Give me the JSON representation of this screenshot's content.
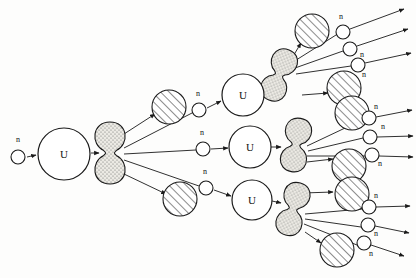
{
  "figure": {
    "domain": "Diagram",
    "width": 416,
    "height": 278,
    "background_color": "#fdfdfc",
    "stroke_color": "#1a1a1a",
    "fragment_fill": "#e8e6e0",
    "hatch_fill": "#ffffff"
  },
  "labels": {
    "neutron": "n",
    "uranium": "U"
  },
  "nuclei": [
    {
      "id": "u-seed",
      "label": "U",
      "cx": 64,
      "cy": 154,
      "r": 26
    },
    {
      "id": "u-top",
      "label": "U",
      "cx": 243,
      "cy": 95,
      "r": 21
    },
    {
      "id": "u-mid",
      "label": "U",
      "cx": 250,
      "cy": 147,
      "r": 21
    },
    {
      "id": "u-bot",
      "label": "U",
      "cx": 252,
      "cy": 200,
      "r": 20
    }
  ],
  "fragments": [
    {
      "id": "frag-seed",
      "cx": 110,
      "cy": 153,
      "rx": 15,
      "ry": 31,
      "rot": 0
    },
    {
      "id": "frag-top",
      "cx": 279,
      "cy": 75,
      "rx": 13,
      "ry": 27,
      "rot": 22
    },
    {
      "id": "frag-mid",
      "cx": 296,
      "cy": 145,
      "rx": 13,
      "ry": 27,
      "rot": 10
    },
    {
      "id": "frag-bot",
      "cx": 293,
      "cy": 209,
      "rx": 13,
      "ry": 27,
      "rot": 16
    }
  ],
  "products": [
    {
      "id": "prod-a",
      "cx": 169,
      "cy": 107,
      "r": 17
    },
    {
      "id": "prod-b",
      "cx": 180,
      "cy": 199,
      "r": 17
    },
    {
      "id": "prod-c",
      "cx": 312,
      "cy": 31,
      "r": 17
    },
    {
      "id": "prod-d",
      "cx": 344,
      "cy": 88,
      "r": 17
    },
    {
      "id": "prod-e",
      "cx": 352,
      "cy": 113,
      "r": 17
    },
    {
      "id": "prod-f",
      "cx": 349,
      "cy": 166,
      "r": 17
    },
    {
      "id": "prod-g",
      "cx": 352,
      "cy": 194,
      "r": 17
    },
    {
      "id": "prod-h",
      "cx": 337,
      "cy": 250,
      "r": 17
    }
  ],
  "neutrons": [
    {
      "id": "n-seed",
      "cx": 18,
      "cy": 157,
      "r": 7,
      "label": "n",
      "lx": 18,
      "ly": 142
    },
    {
      "id": "n-t1",
      "cx": 199,
      "cy": 110,
      "r": 7,
      "label": "n",
      "lx": 198,
      "ly": 96
    },
    {
      "id": "n-m1",
      "cx": 203,
      "cy": 149,
      "r": 7,
      "label": "n",
      "lx": 202,
      "ly": 135
    },
    {
      "id": "n-b1",
      "cx": 206,
      "cy": 188,
      "r": 7,
      "label": "n",
      "lx": 205,
      "ly": 174
    },
    {
      "id": "n-r1",
      "cx": 343,
      "cy": 32,
      "r": 7,
      "label": "n",
      "lx": 341,
      "ly": 19
    },
    {
      "id": "n-r2",
      "cx": 350,
      "cy": 49,
      "r": 7,
      "label": "n",
      "lx": 362,
      "ly": 57
    },
    {
      "id": "n-r3",
      "cx": 358,
      "cy": 65,
      "r": 7,
      "label": "n",
      "lx": 364,
      "ly": 77
    },
    {
      "id": "n-r4",
      "cx": 369,
      "cy": 118,
      "r": 7,
      "label": "n",
      "lx": 376,
      "ly": 109
    },
    {
      "id": "n-r5",
      "cx": 370,
      "cy": 137,
      "r": 7,
      "label": "n",
      "lx": 383,
      "ly": 129
    },
    {
      "id": "n-r6",
      "cx": 372,
      "cy": 155,
      "r": 7,
      "label": "n",
      "lx": 380,
      "ly": 166
    },
    {
      "id": "n-r7",
      "cx": 369,
      "cy": 207,
      "r": 7,
      "label": "n",
      "lx": 376,
      "ly": 198
    },
    {
      "id": "n-r8",
      "cx": 368,
      "cy": 225,
      "r": 7,
      "label": "n",
      "lx": 376,
      "ly": 236
    },
    {
      "id": "n-r9",
      "cx": 364,
      "cy": 243,
      "r": 7,
      "label": "n",
      "lx": 371,
      "ly": 256
    }
  ],
  "arrows": [
    {
      "id": "a-seed-in",
      "x1": 27,
      "y1": 157,
      "x2": 36,
      "y2": 155,
      "head": true
    },
    {
      "id": "a-seed-out",
      "x1": 91,
      "y1": 153,
      "x2": 99,
      "y2": 153,
      "head": true
    },
    {
      "id": "a-prod-a",
      "x1": 124,
      "y1": 134,
      "x2": 155,
      "y2": 114,
      "head": true
    },
    {
      "id": "a-prod-b",
      "x1": 124,
      "y1": 174,
      "x2": 166,
      "y2": 194,
      "head": true
    },
    {
      "id": "a-nt1",
      "x1": 124,
      "y1": 148,
      "x2": 192,
      "y2": 113,
      "head": false
    },
    {
      "id": "a-nm1",
      "x1": 124,
      "y1": 154,
      "x2": 196,
      "y2": 150,
      "head": false
    },
    {
      "id": "a-nb1",
      "x1": 124,
      "y1": 160,
      "x2": 199,
      "y2": 186,
      "head": false
    },
    {
      "id": "a-nt1-u",
      "x1": 207,
      "y1": 108,
      "x2": 221,
      "y2": 101,
      "head": true
    },
    {
      "id": "a-nm1-u",
      "x1": 211,
      "y1": 149,
      "x2": 228,
      "y2": 148,
      "head": true
    },
    {
      "id": "a-nb1-u",
      "x1": 214,
      "y1": 190,
      "x2": 231,
      "y2": 196,
      "head": true
    },
    {
      "id": "a-ut-frag",
      "x1": 263,
      "y1": 88,
      "x2": 272,
      "y2": 83,
      "head": true
    },
    {
      "id": "a-um-frag",
      "x1": 271,
      "y1": 147,
      "x2": 281,
      "y2": 147,
      "head": true
    },
    {
      "id": "a-ub-frag",
      "x1": 272,
      "y1": 201,
      "x2": 281,
      "y2": 203,
      "head": true
    },
    {
      "id": "a-prod-c",
      "x1": 292,
      "y1": 58,
      "x2": 301,
      "y2": 43,
      "head": true
    },
    {
      "id": "a-prod-d",
      "x1": 302,
      "y1": 95,
      "x2": 328,
      "y2": 93,
      "head": true
    },
    {
      "id": "a-prod-f",
      "x1": 307,
      "y1": 162,
      "x2": 333,
      "y2": 159,
      "head": true
    },
    {
      "id": "a-prod-g",
      "x1": 303,
      "y1": 193,
      "x2": 333,
      "y2": 192,
      "head": true
    },
    {
      "id": "a-prod-h",
      "x1": 305,
      "y1": 232,
      "x2": 321,
      "y2": 243,
      "head": true
    },
    {
      "id": "a-nr1",
      "x1": 293,
      "y1": 62,
      "x2": 336,
      "y2": 35,
      "head": false
    },
    {
      "id": "a-nr2",
      "x1": 295,
      "y1": 68,
      "x2": 343,
      "y2": 51,
      "head": false
    },
    {
      "id": "a-nr3",
      "x1": 296,
      "y1": 74,
      "x2": 351,
      "y2": 66,
      "head": false
    },
    {
      "id": "a-nr1-out",
      "x1": 350,
      "y1": 29,
      "x2": 404,
      "y2": 9,
      "head": true
    },
    {
      "id": "a-nr2-out",
      "x1": 357,
      "y1": 46,
      "x2": 408,
      "y2": 29,
      "head": true
    },
    {
      "id": "a-nr3-out",
      "x1": 365,
      "y1": 63,
      "x2": 411,
      "y2": 53,
      "head": true
    },
    {
      "id": "a-nr4",
      "x1": 307,
      "y1": 146,
      "x2": 362,
      "y2": 120,
      "head": false
    },
    {
      "id": "a-nr5",
      "x1": 308,
      "y1": 151,
      "x2": 363,
      "y2": 138,
      "head": false
    },
    {
      "id": "a-nr6",
      "x1": 307,
      "y1": 156,
      "x2": 365,
      "y2": 156,
      "head": false
    },
    {
      "id": "a-nr4-out",
      "x1": 376,
      "y1": 117,
      "x2": 412,
      "y2": 110,
      "head": true
    },
    {
      "id": "a-nr5-out",
      "x1": 377,
      "y1": 137,
      "x2": 413,
      "y2": 136,
      "head": true
    },
    {
      "id": "a-nr6-out",
      "x1": 379,
      "y1": 156,
      "x2": 413,
      "y2": 157,
      "head": true
    },
    {
      "id": "a-nr7",
      "x1": 305,
      "y1": 214,
      "x2": 362,
      "y2": 209,
      "head": false
    },
    {
      "id": "a-nr8",
      "x1": 305,
      "y1": 219,
      "x2": 361,
      "y2": 227,
      "head": false
    },
    {
      "id": "a-nr9",
      "x1": 304,
      "y1": 224,
      "x2": 357,
      "y2": 245,
      "head": false
    },
    {
      "id": "a-nr7-out",
      "x1": 376,
      "y1": 207,
      "x2": 410,
      "y2": 206,
      "head": true
    },
    {
      "id": "a-nr8-out",
      "x1": 375,
      "y1": 226,
      "x2": 409,
      "y2": 233,
      "head": true
    },
    {
      "id": "a-nr9-out",
      "x1": 371,
      "y1": 245,
      "x2": 404,
      "y2": 256,
      "head": true
    }
  ]
}
